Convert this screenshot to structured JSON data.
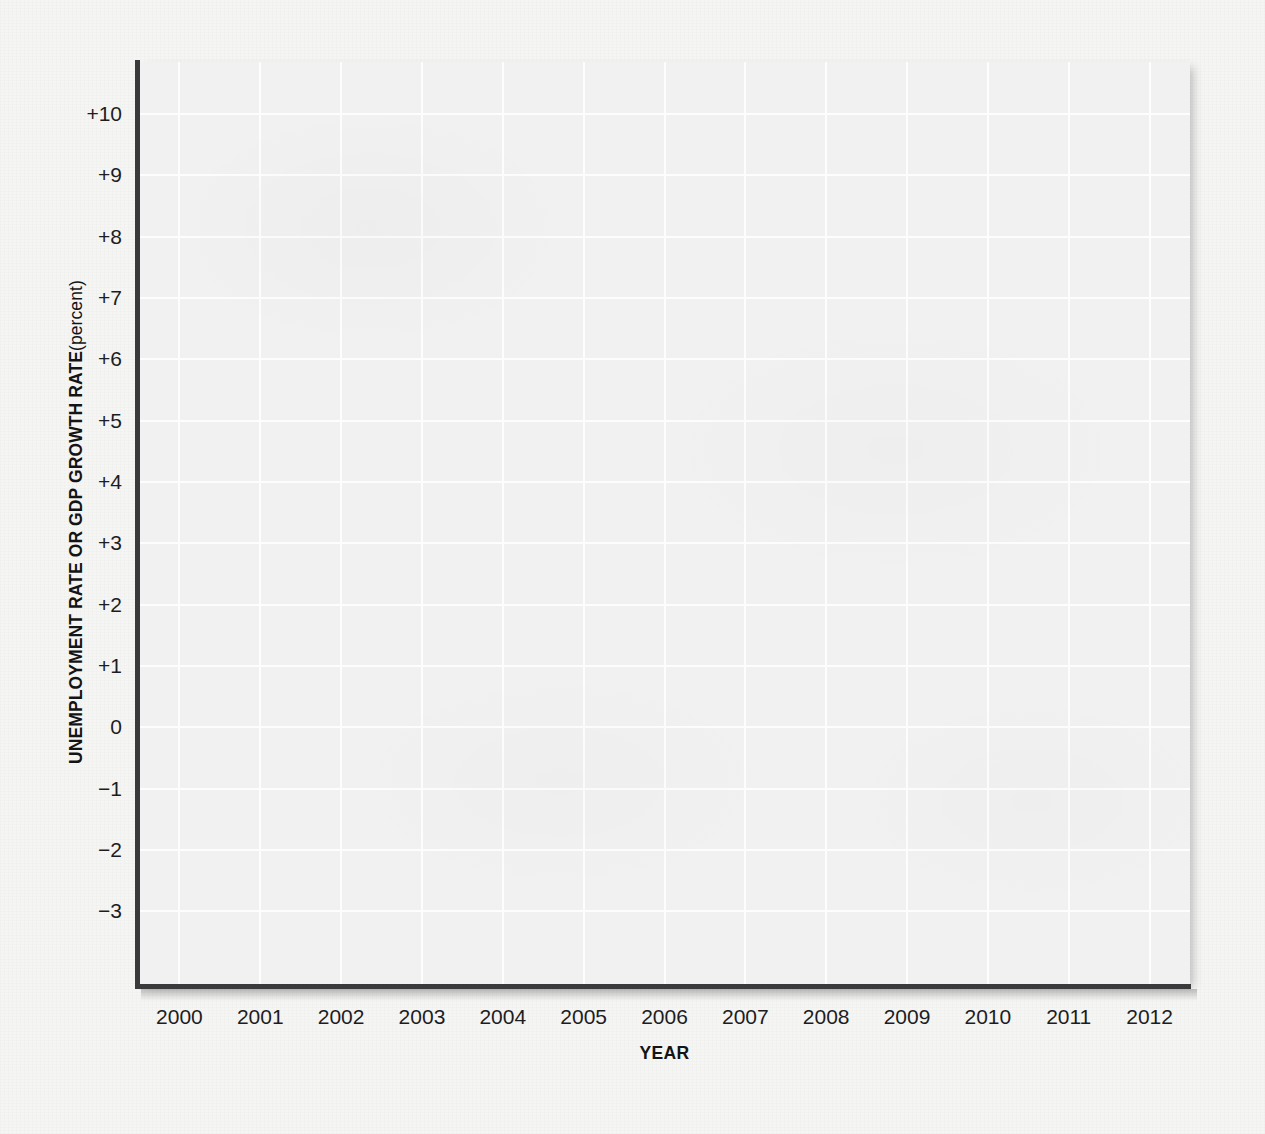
{
  "chart_data": {
    "type": "line",
    "title": "",
    "subtitle": "",
    "xlabel": "YEAR",
    "ylabel": "UNEMPLOYMENT RATE OR GDP GROWTH RATE",
    "ylabel_unit": "(percent)",
    "x": [
      2000,
      2001,
      2002,
      2003,
      2004,
      2005,
      2006,
      2007,
      2008,
      2009,
      2010,
      2011,
      2012
    ],
    "xtick_labels": [
      "2000",
      "2001",
      "2002",
      "2003",
      "2004",
      "2005",
      "2006",
      "2007",
      "2008",
      "2009",
      "2010",
      "2011",
      "2012"
    ],
    "xlim": [
      1999.5,
      2012.5
    ],
    "ytick_values": [
      10,
      9,
      8,
      7,
      6,
      5,
      4,
      3,
      2,
      1,
      0,
      -1,
      -2,
      -3
    ],
    "ytick_labels": [
      "+10",
      "+9",
      "+8",
      "+7",
      "+6",
      "+5",
      "+4",
      "+3",
      "+2",
      "+1",
      "0",
      "−1",
      "−2",
      "−3"
    ],
    "ylim": [
      -4.2,
      10.85
    ],
    "grid": true,
    "legend": null,
    "series": [],
    "annotations": [],
    "note": "Blank plotting grid — axes, gridlines and labels only; no data series are drawn."
  },
  "figure": {
    "panel_background": "#f1f1f2",
    "gridline_color": "#fdfdfd",
    "axis_color": "#3a3a3c",
    "text_color": "#1d1d1f",
    "page_background": "#f5f5f4"
  },
  "showthrough": {
    "top_right": "shown from the reverse side\n\nhow much it is expected to grow\nby the labor force and\nhow fast real GDP increases",
    "middle_right": "growth rate of real GDP and the\nunemployment rate move in\nopposite directions over the\nbusiness cycle, so when output\nexpands rapidly the jobless rate\nfalls, and when output growth\nslows the jobless rate rises\nagain across the economy",
    "left_margin": "reverse page text"
  }
}
